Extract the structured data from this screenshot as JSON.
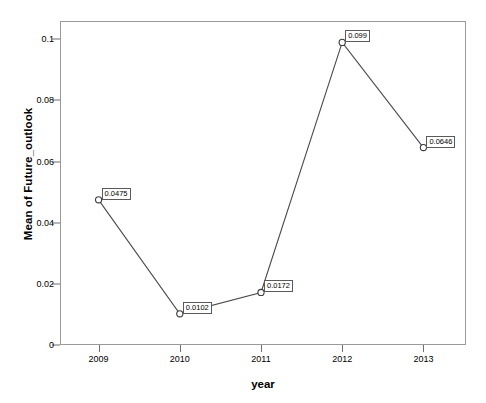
{
  "chart_data": {
    "type": "line",
    "title": "",
    "xlabel": "year",
    "ylabel": "Mean of Future_outlook",
    "categories": [
      "2009",
      "2010",
      "2011",
      "2012",
      "2013"
    ],
    "values": [
      0.0475,
      0.0102,
      0.0172,
      0.099,
      0.0646
    ],
    "point_labels": [
      "0.0475",
      "0.0102",
      "0.0172",
      "0.099",
      "0.0646"
    ],
    "ylim": [
      0,
      0.106
    ],
    "ytick_values": [
      0,
      0.02,
      0.04,
      0.06,
      0.08,
      0.1
    ],
    "ytick_labels": [
      "0",
      "0.02",
      "0.04",
      "0.06",
      "0.08",
      "0.1"
    ],
    "xtick_labels": [
      "2009",
      "2010",
      "2011",
      "2012",
      "2013"
    ],
    "grid": false,
    "legend": "none",
    "series": [
      {
        "name": "Mean of Future_outlook",
        "values": [
          0.0475,
          0.0102,
          0.0172,
          0.099,
          0.0646
        ]
      }
    ],
    "colors": {
      "line": "#4a4a4a",
      "marker_stroke": "#3a3a3a",
      "marker_fill": "#ffffff",
      "axis": "#9a9a9a",
      "text": "#000000",
      "label_box_border": "#5a5a5a",
      "label_box_fill": "#ffffff",
      "background": "#ffffff"
    }
  }
}
